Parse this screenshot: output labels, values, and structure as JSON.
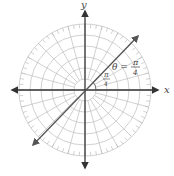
{
  "figure": {
    "type": "polar-graph",
    "center": {
      "x": 85,
      "y": 90
    },
    "ring_count": 6,
    "ring_spacing": 11,
    "spoke_step_deg": 15,
    "outer_tick_step_deg": 5,
    "grid_color": "#bdbdbd",
    "axis_color": "#333333",
    "line_color": "#555555"
  },
  "axes": {
    "x_label": "x",
    "y_label": "y"
  },
  "line": {
    "equation_lhs": "θ =",
    "equation_num": "π",
    "equation_den": "4",
    "angle_num": "π",
    "angle_den": "4",
    "start": {
      "x": 33,
      "y": 145
    },
    "end": {
      "x": 138,
      "y": 36
    }
  }
}
